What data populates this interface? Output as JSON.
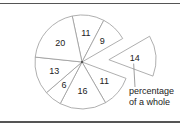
{
  "chart_data": {
    "type": "pie",
    "title": "",
    "slices": [
      {
        "label": "11",
        "value": 11,
        "exploded": false
      },
      {
        "label": "9",
        "value": 9,
        "exploded": false
      },
      {
        "label": "14",
        "value": 14,
        "exploded": true
      },
      {
        "label": "11",
        "value": 11,
        "exploded": false
      },
      {
        "label": "16",
        "value": 16,
        "exploded": false
      },
      {
        "label": "6",
        "value": 6,
        "exploded": false
      },
      {
        "label": "13",
        "value": 13,
        "exploded": false
      },
      {
        "label": "20",
        "value": 20,
        "exploded": false
      }
    ],
    "categories": [
      "11",
      "9",
      "14",
      "11",
      "16",
      "6",
      "13",
      "20"
    ],
    "values": [
      11,
      9,
      14,
      11,
      16,
      6,
      13,
      20
    ],
    "start_angle_deg": -12,
    "direction": "clockwise",
    "annotations": [
      {
        "text": "percentage of a whole",
        "points_to": "14"
      }
    ]
  },
  "annotation": {
    "line1": "percentage",
    "line2": "of a whole"
  }
}
